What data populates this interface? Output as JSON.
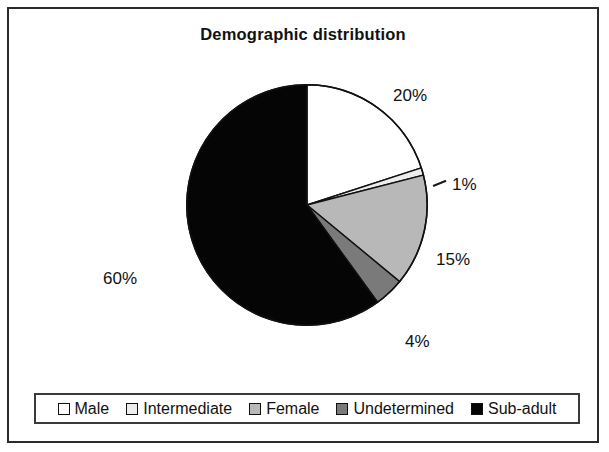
{
  "chart": {
    "title": "Demographic distribution"
  },
  "chart_data": {
    "type": "pie",
    "title": "Demographic distribution",
    "xlabel": "",
    "ylabel": "",
    "categories": [
      "Male",
      "Intermediate",
      "Female",
      "Undetermined",
      "Sub-adult"
    ],
    "values": [
      20,
      1,
      15,
      4,
      60
    ],
    "value_labels": [
      "20%",
      "1%",
      "15%",
      "4%",
      "60%"
    ],
    "colors": [
      "#ffffff",
      "#ededed",
      "#b8b8b8",
      "#7a7a7a",
      "#050505"
    ],
    "slice_border_color": "#111111",
    "start_angle_deg": 0,
    "direction": "clockwise",
    "legend_position": "bottom",
    "grid": false,
    "units": "percent"
  },
  "legend": {
    "items": [
      {
        "label": "Male",
        "color": "#ffffff",
        "value_label": "20%"
      },
      {
        "label": "Intermediate",
        "color": "#ededed",
        "value_label": "1%"
      },
      {
        "label": "Female",
        "color": "#b8b8b8",
        "value_label": "15%"
      },
      {
        "label": "Undetermined",
        "color": "#7a7a7a",
        "value_label": "4%"
      },
      {
        "label": "Sub-adult",
        "color": "#050505",
        "value_label": "60%"
      }
    ]
  }
}
